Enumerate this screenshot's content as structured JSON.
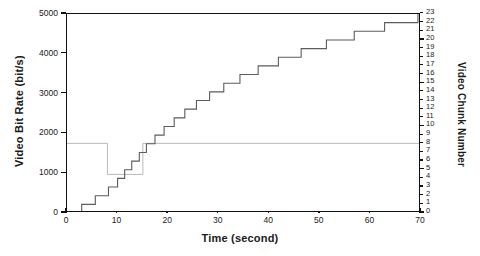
{
  "chart_data": {
    "type": "line",
    "title": "",
    "xlabel": "Time (second)",
    "ylabel": "Video Bit Rate (bit/s)",
    "ylabel_right": "Video Chunk Number",
    "xlim": [
      0,
      70
    ],
    "ylim": [
      0,
      5000
    ],
    "ylim_right": [
      0,
      23
    ],
    "grid": false,
    "legend": null,
    "xticks": [
      0,
      10,
      20,
      30,
      40,
      50,
      60,
      70
    ],
    "xtick_labels": [
      "0",
      "10",
      "20",
      "30",
      "40",
      "50",
      "60",
      "70"
    ],
    "yticks": [
      0,
      1000,
      2000,
      3000,
      4000,
      5000
    ],
    "ytick_labels": [
      "0",
      "1000",
      "2000",
      "3000",
      "4000",
      "5000"
    ],
    "yticks_right": [
      0,
      1,
      2,
      3,
      4,
      5,
      6,
      7,
      8,
      9,
      10,
      11,
      12,
      13,
      14,
      15,
      16,
      17,
      18,
      19,
      20,
      21,
      22,
      23
    ],
    "ytick_right_labels": [
      "0",
      "1",
      "2",
      "3",
      "4",
      "5",
      "6",
      "7",
      "8",
      "9",
      "10",
      "11",
      "12",
      "13",
      "14",
      "15",
      "16",
      "17",
      "18",
      "19",
      "20",
      "21",
      "22",
      "23"
    ],
    "series": [
      {
        "name": "Video Bit Rate",
        "axis": "left",
        "color": "#b9b9b9",
        "style": "step-post",
        "points": [
          {
            "x": 0.0,
            "y": 1750
          },
          {
            "x": 8.0,
            "y": 1750
          },
          {
            "x": 8.0,
            "y": 970
          },
          {
            "x": 15.0,
            "y": 970
          },
          {
            "x": 15.0,
            "y": 1750
          },
          {
            "x": 70.0,
            "y": 1750
          }
        ]
      },
      {
        "name": "Video Chunk Number",
        "axis": "right",
        "color": "#5c5c5c",
        "style": "step-post",
        "points": [
          {
            "x": 2.9,
            "y": 0
          },
          {
            "x": 2.9,
            "y": 1
          },
          {
            "x": 5.6,
            "y": 1
          },
          {
            "x": 5.6,
            "y": 2
          },
          {
            "x": 8.2,
            "y": 2
          },
          {
            "x": 8.2,
            "y": 3
          },
          {
            "x": 10.0,
            "y": 3
          },
          {
            "x": 10.0,
            "y": 4
          },
          {
            "x": 11.4,
            "y": 4
          },
          {
            "x": 11.4,
            "y": 5
          },
          {
            "x": 12.8,
            "y": 5
          },
          {
            "x": 12.8,
            "y": 6
          },
          {
            "x": 14.3,
            "y": 6
          },
          {
            "x": 14.3,
            "y": 7
          },
          {
            "x": 15.7,
            "y": 7
          },
          {
            "x": 15.7,
            "y": 8
          },
          {
            "x": 17.4,
            "y": 8
          },
          {
            "x": 17.4,
            "y": 9
          },
          {
            "x": 19.2,
            "y": 9
          },
          {
            "x": 19.2,
            "y": 10
          },
          {
            "x": 21.2,
            "y": 10
          },
          {
            "x": 21.2,
            "y": 11
          },
          {
            "x": 23.3,
            "y": 11
          },
          {
            "x": 23.3,
            "y": 12
          },
          {
            "x": 25.6,
            "y": 12
          },
          {
            "x": 25.6,
            "y": 13
          },
          {
            "x": 28.2,
            "y": 13
          },
          {
            "x": 28.2,
            "y": 14
          },
          {
            "x": 31.0,
            "y": 14
          },
          {
            "x": 31.0,
            "y": 15
          },
          {
            "x": 34.2,
            "y": 15
          },
          {
            "x": 34.2,
            "y": 16
          },
          {
            "x": 37.8,
            "y": 16
          },
          {
            "x": 37.8,
            "y": 17
          },
          {
            "x": 41.8,
            "y": 17
          },
          {
            "x": 41.8,
            "y": 18
          },
          {
            "x": 46.3,
            "y": 18
          },
          {
            "x": 46.3,
            "y": 19
          },
          {
            "x": 51.3,
            "y": 19
          },
          {
            "x": 51.3,
            "y": 20
          },
          {
            "x": 56.8,
            "y": 20
          },
          {
            "x": 56.8,
            "y": 21
          },
          {
            "x": 62.8,
            "y": 21
          },
          {
            "x": 62.8,
            "y": 22
          },
          {
            "x": 69.4,
            "y": 22
          },
          {
            "x": 69.4,
            "y": 23
          }
        ]
      }
    ]
  }
}
